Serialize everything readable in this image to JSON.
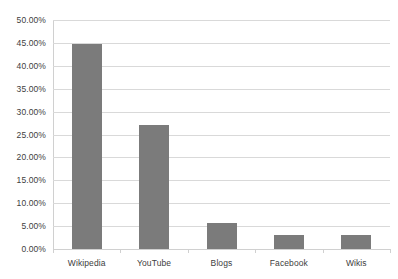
{
  "chart_data": {
    "type": "bar",
    "title": "",
    "xlabel": "",
    "ylabel": "",
    "categories": [
      "Wikipedia",
      "YouTube",
      "Blogs",
      "Facebook",
      "Wikis"
    ],
    "values": [
      44.8,
      27.1,
      5.7,
      3.1,
      3.1
    ],
    "value_labels": [
      "44.80%",
      "27.10%",
      "5.70%",
      "3.10%",
      "3.10%"
    ],
    "ylim": [
      0,
      50
    ],
    "ytick_values": [
      0,
      5,
      10,
      15,
      20,
      25,
      30,
      35,
      40,
      45,
      50
    ],
    "ytick_labels": [
      "0.00%",
      "5.00%",
      "10.00%",
      "15.00%",
      "20.00%",
      "25.00%",
      "30.00%",
      "35.00%",
      "40.00%",
      "45.00%",
      "50.00%"
    ],
    "grid": true,
    "grid_axis": "y",
    "legend": false,
    "legend_position": "none",
    "series": [
      {
        "name": "",
        "values": [
          44.8,
          27.1,
          5.7,
          3.1,
          3.1
        ]
      }
    ]
  },
  "style": {
    "bar_color": "#7b7b7b",
    "gridline_color": "#d9d9d9",
    "axis_color": "#d0d0d0",
    "text_color": "#404040",
    "background": "#ffffff"
  }
}
